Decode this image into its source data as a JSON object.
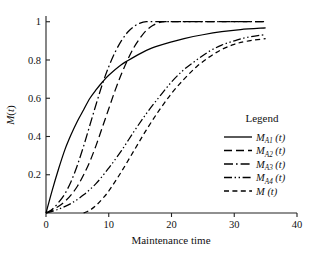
{
  "chart_data": {
    "type": "line",
    "title": "",
    "xlabel": "Maintenance time",
    "ylabel": "M(t)",
    "xlim": [
      0,
      40
    ],
    "ylim": [
      0,
      1.03
    ],
    "xticks": [
      0,
      10,
      20,
      30,
      40
    ],
    "xticklabels": [
      "0",
      "10",
      "20",
      "30",
      "40"
    ],
    "yticks": [
      0.2,
      0.4,
      0.6,
      0.8,
      1
    ],
    "yticklabels": [
      "0.2",
      "0.4",
      "0.6",
      "0.8",
      "1"
    ],
    "grid": false,
    "legend_position": "right",
    "legend_title": "Legend",
    "series": [
      {
        "name": "M_A1 (t)",
        "label_main": "M",
        "label_sub": "A1",
        "label_tail": "(t)",
        "linestyle": "solid",
        "color": "#000000",
        "x": [
          0,
          1,
          2,
          3,
          4,
          5,
          6,
          7,
          8,
          9,
          10,
          12,
          14,
          16,
          18,
          20,
          22,
          25,
          28,
          31,
          35
        ],
        "values": [
          0.0,
          0.12,
          0.23,
          0.33,
          0.41,
          0.48,
          0.54,
          0.6,
          0.645,
          0.685,
          0.72,
          0.775,
          0.815,
          0.85,
          0.875,
          0.895,
          0.912,
          0.932,
          0.948,
          0.959,
          0.968
        ]
      },
      {
        "name": "M_A2 (t)",
        "label_main": "M",
        "label_sub": "A2",
        "label_tail": "(t)",
        "linestyle": "long-dash",
        "color": "#000000",
        "x": [
          0,
          1,
          2,
          3,
          4,
          5,
          6,
          7,
          8,
          9,
          10,
          11,
          12,
          13,
          14,
          15,
          16,
          17,
          18,
          19,
          22,
          26,
          30,
          35
        ],
        "values": [
          0.0,
          0.015,
          0.035,
          0.06,
          0.095,
          0.14,
          0.2,
          0.27,
          0.355,
          0.45,
          0.545,
          0.64,
          0.725,
          0.8,
          0.865,
          0.915,
          0.955,
          0.98,
          0.995,
          1.0,
          1.0,
          1.0,
          1.0,
          1.0
        ]
      },
      {
        "name": "M_A3 (t)",
        "label_main": "M",
        "label_sub": "A3",
        "label_tail": "(t)",
        "linestyle": "dash-dot",
        "color": "#000000",
        "x": [
          0,
          1,
          2,
          3,
          4,
          5,
          6,
          7,
          8,
          9,
          10,
          11,
          12,
          13,
          14,
          15,
          16,
          18,
          22,
          26,
          30,
          35
        ],
        "values": [
          0.0,
          0.02,
          0.055,
          0.1,
          0.165,
          0.25,
          0.35,
          0.46,
          0.57,
          0.675,
          0.765,
          0.84,
          0.9,
          0.945,
          0.975,
          0.993,
          1.0,
          1.0,
          1.0,
          1.0,
          1.0,
          1.0
        ]
      },
      {
        "name": "M_A4 (t)",
        "label_main": "M",
        "label_sub": "A4",
        "label_tail": "(t)",
        "linestyle": "dash-dot-dot",
        "color": "#000000",
        "x": [
          0,
          2,
          4,
          6,
          8,
          10,
          12,
          14,
          16,
          18,
          20,
          22,
          24,
          26,
          28,
          30,
          32,
          35
        ],
        "values": [
          0.0,
          0.02,
          0.05,
          0.095,
          0.155,
          0.235,
          0.325,
          0.425,
          0.52,
          0.605,
          0.685,
          0.75,
          0.8,
          0.845,
          0.878,
          0.9,
          0.918,
          0.933
        ]
      },
      {
        "name": "M (t)",
        "label_main": "M",
        "label_sub": "",
        "label_tail": "(t)",
        "linestyle": "short-dash",
        "color": "#000000",
        "x": [
          6,
          7,
          8,
          9,
          10,
          12,
          14,
          16,
          18,
          20,
          22,
          24,
          26,
          28,
          30,
          32,
          35
        ],
        "values": [
          0.0,
          0.015,
          0.04,
          0.075,
          0.115,
          0.215,
          0.325,
          0.435,
          0.535,
          0.625,
          0.7,
          0.765,
          0.815,
          0.855,
          0.882,
          0.898,
          0.912
        ]
      }
    ]
  }
}
